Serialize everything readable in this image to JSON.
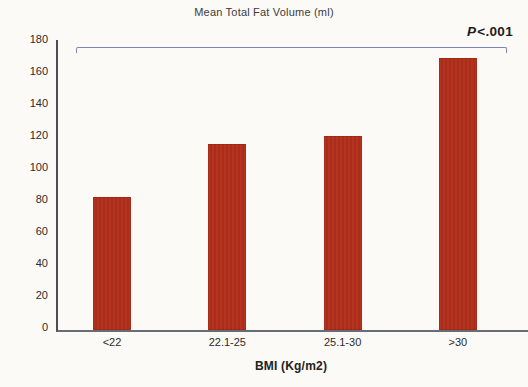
{
  "chart_data": {
    "type": "bar",
    "title": "Mean Total Fat Volume (ml)",
    "xlabel": "BMI (Kg/m2)",
    "ylabel": "",
    "categories": [
      "<22",
      "22.1-25",
      "25.1-30",
      ">30"
    ],
    "values": [
      83,
      116,
      121,
      170
    ],
    "ylim": [
      0,
      180
    ],
    "yticks": [
      0,
      20,
      40,
      60,
      80,
      100,
      120,
      140,
      160,
      180
    ],
    "grid": false,
    "legend": "none",
    "annotation": {
      "p_symbol": "P",
      "p_rest": "<.001",
      "bracket_span": "all categories"
    },
    "colors": {
      "bar": "#b6341f",
      "bracket": "#7d86ba",
      "axis": "#4d4f52",
      "background": "#fbfaf6"
    }
  }
}
